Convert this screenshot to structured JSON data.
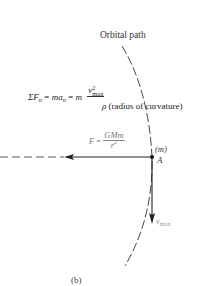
{
  "diagram": {
    "title": "Orbital path",
    "equation_normal": {
      "sum_symbol": "ΣF",
      "sum_sub": "n",
      "eq1": " = ",
      "ma": "ma",
      "ma_sub": "n",
      "eq2": " = ",
      "m": "m",
      "v": "v",
      "v_sup": "2",
      "v_sub": "max",
      "rho": "ρ",
      "rho_note": " (radius of curvature)"
    },
    "equation_gravity": {
      "lhs": "F",
      "eq": " = ",
      "numerator": "GMm",
      "denominator": "r",
      "den_sup": "2"
    },
    "mass_label": "(m)",
    "point_label": "A",
    "velocity_label": "v",
    "velocity_sub": "max",
    "caption": "(b)",
    "colors": {
      "ink": "#222222",
      "gray_label": "#777777"
    }
  }
}
